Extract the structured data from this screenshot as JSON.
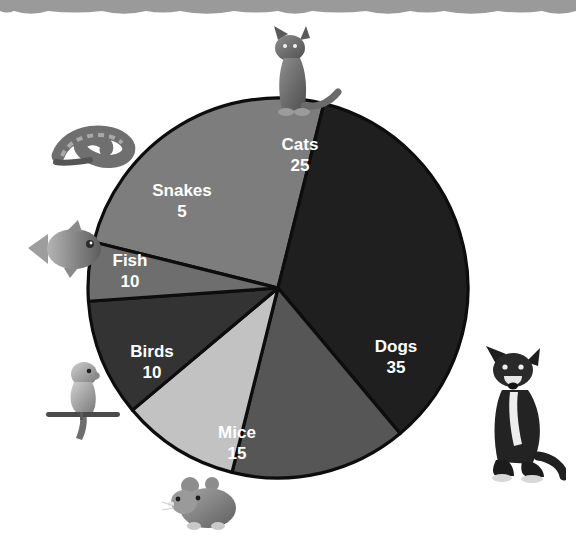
{
  "figure": {
    "background_color": "#ffffff",
    "top_band": {
      "name": "torn-paper-band",
      "color": "#9a9a9a",
      "height": 16
    }
  },
  "chart_data": {
    "type": "pie",
    "title": "",
    "xlabel": "",
    "ylabel": "",
    "total": 100,
    "legend_position": "none",
    "labels_inside_slices": true,
    "grid": false,
    "categories": [
      "Cats",
      "Dogs",
      "Mice",
      "Birds",
      "Fish",
      "Snakes"
    ],
    "values": [
      25,
      35,
      15,
      10,
      10,
      5
    ],
    "slices": [
      {
        "label": "Cats",
        "value": 25,
        "value_text": "25",
        "color": "#7d7d7d",
        "start_angle": -76,
        "end_angle": 14,
        "label_x": 300,
        "label_y": 146,
        "value_x": 300,
        "value_y": 167
      },
      {
        "label": "Dogs",
        "value": 35,
        "value_text": "35",
        "color": "#1f1f1f",
        "start_angle": 14,
        "end_angle": 140,
        "label_x": 396,
        "label_y": 348,
        "value_x": 396,
        "value_y": 369
      },
      {
        "label": "Mice",
        "value": 15,
        "value_text": "15",
        "color": "#565656",
        "start_angle": 140,
        "end_angle": 194,
        "label_x": 237,
        "label_y": 434,
        "value_x": 237,
        "value_y": 455
      },
      {
        "label": "Birds",
        "value": 10,
        "value_text": "10",
        "color": "#c2c2c2",
        "start_angle": 194,
        "end_angle": 230,
        "label_x": 152,
        "label_y": 353,
        "value_x": 152,
        "value_y": 374
      },
      {
        "label": "Fish",
        "value": 10,
        "value_text": "10",
        "color": "#333333",
        "start_angle": 230,
        "end_angle": 266,
        "label_x": 130,
        "label_y": 262,
        "value_x": 130,
        "value_y": 283
      },
      {
        "label": "Snakes",
        "value": 5,
        "value_text": "5",
        "color": "#6e6e6e",
        "start_angle": 266,
        "end_angle": 284,
        "label_x": 182,
        "label_y": 192,
        "value_x": 182,
        "value_y": 213
      }
    ],
    "geometry": {
      "center_x": 278,
      "center_y": 288,
      "radius": 190
    }
  },
  "photos": [
    {
      "name": "cat-photo",
      "animal": "cat",
      "x": 248,
      "y": 22,
      "w": 96,
      "h": 100
    },
    {
      "name": "snake-photo",
      "animal": "snake",
      "x": 46,
      "y": 116,
      "w": 96,
      "h": 56
    },
    {
      "name": "fish-photo",
      "animal": "fish",
      "x": 22,
      "y": 218,
      "w": 86,
      "h": 62
    },
    {
      "name": "bird-photo",
      "animal": "bird",
      "x": 42,
      "y": 352,
      "w": 82,
      "h": 90
    },
    {
      "name": "mouse-photo",
      "animal": "mouse",
      "x": 160,
      "y": 472,
      "w": 90,
      "h": 62
    },
    {
      "name": "dog-photo",
      "animal": "dog",
      "x": 466,
      "y": 336,
      "w": 100,
      "h": 148
    }
  ]
}
